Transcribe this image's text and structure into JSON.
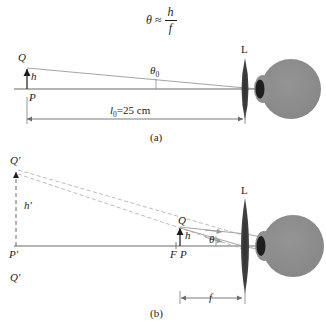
{
  "figure": {
    "title_formula": {
      "theta": "θ",
      "approx": "≈",
      "numerator": "h",
      "denominator": "f"
    },
    "panels": [
      {
        "id": "a",
        "caption": "(a)",
        "labels": {
          "object_top": "Q",
          "object_base": "P",
          "object_height": "h",
          "angle": "θ",
          "angle_subscript": "0",
          "lens": "L",
          "distance": "l",
          "distance_subscript": "0",
          "distance_value": "=25 cm"
        }
      },
      {
        "id": "b",
        "caption": "(b)",
        "labels": {
          "image_top": "Q′",
          "image_base": "P′",
          "image_top_lower": "Q′",
          "image_height": "h′",
          "object_top": "Q",
          "object_base": "P",
          "focal_point": "F",
          "object_height": "h",
          "angle": "θ",
          "lens": "L",
          "focal_length": "f"
        }
      }
    ],
    "colors": {
      "ink": "#1c1c1c",
      "axis": "#6b6b6b",
      "ray": "#9a9a9a",
      "dashed_ray": "#b4b4b4",
      "eye_fill": "#8a8a8a",
      "cornea_fill": "#2a2a2a",
      "lens_fill": "#3a3a3a",
      "dimension": "#6b6b6b"
    }
  }
}
